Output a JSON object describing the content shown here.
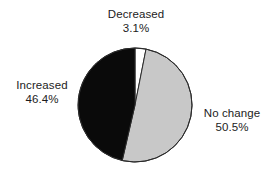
{
  "chart_data": {
    "type": "pie",
    "title": "",
    "subtitle": "",
    "xlabel": "",
    "ylabel": "",
    "legend_position": "none",
    "grid": false,
    "labels_outside": true,
    "start_angle_deg": 0,
    "direction": "clockwise",
    "categories": [
      "Decreased",
      "No change",
      "Increased"
    ],
    "values": [
      3.1,
      50.5,
      46.4
    ],
    "value_suffix": "%",
    "slices": [
      {
        "name": "Decreased",
        "value": 3.1,
        "value_text": "3.1%",
        "color": "#ffffff",
        "stroke": "#2b2b2b",
        "label_position": "top"
      },
      {
        "name": "No change",
        "value": 50.5,
        "value_text": "50.5%",
        "color": "#c8c8c8",
        "stroke": "#2b2b2b",
        "label_position": "right"
      },
      {
        "name": "Increased",
        "value": 46.4,
        "value_text": "46.4%",
        "color": "#0a0a0a",
        "stroke": "#2b2b2b",
        "label_position": "left"
      }
    ],
    "annotations": []
  },
  "figure": {
    "background_color": "#ffffff",
    "text_color": "#1c1c1c",
    "outline_color": "#2b2b2b"
  }
}
